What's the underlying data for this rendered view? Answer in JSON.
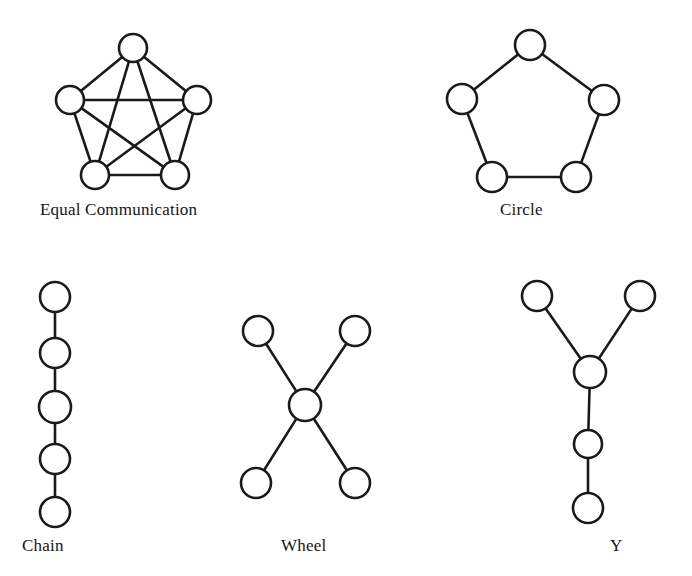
{
  "figure": {
    "background_color": "#ffffff",
    "stroke_color": "#1a1a1a",
    "node_fill_color": "#ffffff",
    "width": 692,
    "height": 576
  },
  "diagrams": [
    {
      "id": "equal-communication",
      "label": "Equal Communication",
      "graph_type": "complete",
      "node_count": 5,
      "edge_count": 10,
      "nodes": [
        {
          "id": "ec-top",
          "cx": 133,
          "cy": 48,
          "r": 14
        },
        {
          "id": "ec-left",
          "cx": 70,
          "cy": 100,
          "r": 14
        },
        {
          "id": "ec-right",
          "cx": 197,
          "cy": 100,
          "r": 14
        },
        {
          "id": "ec-bottom-left",
          "cx": 95,
          "cy": 175,
          "r": 14
        },
        {
          "id": "ec-bottom-right",
          "cx": 175,
          "cy": 175,
          "r": 14
        }
      ],
      "edges": [
        [
          "ec-top",
          "ec-left"
        ],
        [
          "ec-top",
          "ec-right"
        ],
        [
          "ec-top",
          "ec-bottom-left"
        ],
        [
          "ec-top",
          "ec-bottom-right"
        ],
        [
          "ec-left",
          "ec-right"
        ],
        [
          "ec-left",
          "ec-bottom-left"
        ],
        [
          "ec-left",
          "ec-bottom-right"
        ],
        [
          "ec-right",
          "ec-bottom-left"
        ],
        [
          "ec-right",
          "ec-bottom-right"
        ],
        [
          "ec-bottom-left",
          "ec-bottom-right"
        ]
      ]
    },
    {
      "id": "circle",
      "label": "Circle",
      "graph_type": "cycle",
      "node_count": 5,
      "edge_count": 5,
      "nodes": [
        {
          "id": "ci-top",
          "cx": 530,
          "cy": 45,
          "r": 15
        },
        {
          "id": "ci-right",
          "cx": 604,
          "cy": 100,
          "r": 15
        },
        {
          "id": "ci-bottom-right",
          "cx": 576,
          "cy": 177,
          "r": 15
        },
        {
          "id": "ci-bottom-left",
          "cx": 492,
          "cy": 177,
          "r": 15
        },
        {
          "id": "ci-left",
          "cx": 462,
          "cy": 99,
          "r": 15
        }
      ],
      "edges": [
        [
          "ci-top",
          "ci-right"
        ],
        [
          "ci-right",
          "ci-bottom-right"
        ],
        [
          "ci-bottom-right",
          "ci-bottom-left"
        ],
        [
          "ci-bottom-left",
          "ci-left"
        ],
        [
          "ci-left",
          "ci-top"
        ]
      ]
    },
    {
      "id": "chain",
      "label": "Chain",
      "graph_type": "path",
      "node_count": 5,
      "edge_count": 4,
      "nodes": [
        {
          "id": "ch-1",
          "cx": 55,
          "cy": 297,
          "r": 15
        },
        {
          "id": "ch-2",
          "cx": 55,
          "cy": 353,
          "r": 15
        },
        {
          "id": "ch-3",
          "cx": 55,
          "cy": 407,
          "r": 16
        },
        {
          "id": "ch-4",
          "cx": 55,
          "cy": 459,
          "r": 15
        },
        {
          "id": "ch-5",
          "cx": 55,
          "cy": 512,
          "r": 15
        }
      ],
      "edges": [
        [
          "ch-1",
          "ch-2"
        ],
        [
          "ch-2",
          "ch-3"
        ],
        [
          "ch-3",
          "ch-4"
        ],
        [
          "ch-4",
          "ch-5"
        ]
      ]
    },
    {
      "id": "wheel",
      "label": "Wheel",
      "graph_type": "star",
      "node_count": 5,
      "edge_count": 4,
      "nodes": [
        {
          "id": "wh-center",
          "cx": 305,
          "cy": 405,
          "r": 16
        },
        {
          "id": "wh-top-left",
          "cx": 258,
          "cy": 331,
          "r": 15
        },
        {
          "id": "wh-top-right",
          "cx": 355,
          "cy": 331,
          "r": 15
        },
        {
          "id": "wh-bottom-left",
          "cx": 256,
          "cy": 483,
          "r": 15
        },
        {
          "id": "wh-bottom-right",
          "cx": 355,
          "cy": 483,
          "r": 15
        }
      ],
      "edges": [
        [
          "wh-center",
          "wh-top-left"
        ],
        [
          "wh-center",
          "wh-top-right"
        ],
        [
          "wh-center",
          "wh-bottom-left"
        ],
        [
          "wh-center",
          "wh-bottom-right"
        ]
      ]
    },
    {
      "id": "y",
      "label": "Y",
      "graph_type": "tree",
      "node_count": 5,
      "edge_count": 4,
      "nodes": [
        {
          "id": "y-top-left",
          "cx": 537,
          "cy": 296,
          "r": 15
        },
        {
          "id": "y-top-right",
          "cx": 640,
          "cy": 296,
          "r": 15
        },
        {
          "id": "y-junction",
          "cx": 590,
          "cy": 372,
          "r": 16
        },
        {
          "id": "y-middle",
          "cx": 588,
          "cy": 444,
          "r": 14
        },
        {
          "id": "y-bottom",
          "cx": 588,
          "cy": 508,
          "r": 15
        }
      ],
      "edges": [
        [
          "y-top-left",
          "y-junction"
        ],
        [
          "y-top-right",
          "y-junction"
        ],
        [
          "y-junction",
          "y-middle"
        ],
        [
          "y-middle",
          "y-bottom"
        ]
      ]
    }
  ]
}
